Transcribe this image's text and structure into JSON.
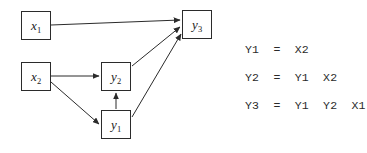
{
  "diagram": {
    "type": "directed-graph",
    "background_color": "#ffffff",
    "stroke_color": "#2b2b2b",
    "nodes": [
      {
        "id": "x1",
        "base": "x",
        "sub": "1",
        "label": "x1",
        "x": 21,
        "y": 11,
        "w": 30,
        "h": 29
      },
      {
        "id": "x2",
        "base": "x",
        "sub": "2",
        "label": "x2",
        "x": 21,
        "y": 62,
        "w": 30,
        "h": 29
      },
      {
        "id": "y2",
        "base": "y",
        "sub": "2",
        "label": "y2",
        "x": 101,
        "y": 62,
        "w": 30,
        "h": 29
      },
      {
        "id": "y1",
        "base": "y",
        "sub": "1",
        "label": "y1",
        "x": 101,
        "y": 110,
        "w": 30,
        "h": 29
      },
      {
        "id": "y3",
        "base": "y",
        "sub": "3",
        "label": "y3",
        "x": 182,
        "y": 10,
        "w": 30,
        "h": 29
      }
    ],
    "edges": [
      {
        "from": "x1",
        "to": "y3",
        "x1": 51,
        "y1": 25,
        "x2": 180,
        "y2": 20
      },
      {
        "from": "x2",
        "to": "y2",
        "x1": 51,
        "y1": 76,
        "x2": 99,
        "y2": 76
      },
      {
        "from": "x2",
        "to": "y1",
        "x1": 51,
        "y1": 82,
        "x2": 99,
        "y2": 124
      },
      {
        "from": "y1",
        "to": "y2",
        "x1": 116,
        "y1": 109,
        "x2": 116,
        "y2": 93
      },
      {
        "from": "y2",
        "to": "y3",
        "x1": 132,
        "y1": 66,
        "x2": 180,
        "y2": 27
      },
      {
        "from": "y1",
        "to": "y3",
        "x1": 132,
        "y1": 117,
        "x2": 181,
        "y2": 34
      }
    ]
  },
  "equations": {
    "lines": [
      "Y1  =  X2",
      "Y2  =  Y1  X2",
      "Y3  =  Y1  Y2  X1"
    ]
  }
}
